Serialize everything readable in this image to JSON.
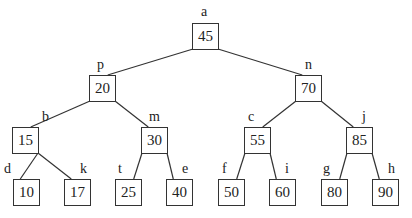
{
  "diagram": {
    "type": "binary-search-tree",
    "stroke_color": "#333333",
    "nodes": [
      {
        "id": "a",
        "label": "a",
        "value": "45",
        "x": 192,
        "y": 23,
        "lx": 201,
        "ly": 5
      },
      {
        "id": "p",
        "label": "p",
        "value": "20",
        "x": 89,
        "y": 75,
        "lx": 97,
        "ly": 58
      },
      {
        "id": "n",
        "label": "n",
        "value": "70",
        "x": 295,
        "y": 75,
        "lx": 305,
        "ly": 58
      },
      {
        "id": "b",
        "label": "b",
        "value": "15",
        "x": 12,
        "y": 127,
        "lx": 42,
        "ly": 110
      },
      {
        "id": "m",
        "label": "m",
        "value": "30",
        "x": 141,
        "y": 127,
        "lx": 149,
        "ly": 110
      },
      {
        "id": "c",
        "label": "c",
        "value": "55",
        "x": 244,
        "y": 127,
        "lx": 248,
        "ly": 110
      },
      {
        "id": "j",
        "label": "j",
        "value": "85",
        "x": 346,
        "y": 127,
        "lx": 362,
        "ly": 110
      },
      {
        "id": "d",
        "label": "d",
        "value": "10",
        "x": 13,
        "y": 179,
        "lx": 4,
        "ly": 162
      },
      {
        "id": "k",
        "label": "k",
        "value": "17",
        "x": 64,
        "y": 179,
        "lx": 80,
        "ly": 162
      },
      {
        "id": "t",
        "label": "t",
        "value": "25",
        "x": 115,
        "y": 179,
        "lx": 118,
        "ly": 162
      },
      {
        "id": "e",
        "label": "e",
        "value": "40",
        "x": 166,
        "y": 179,
        "lx": 182,
        "ly": 162
      },
      {
        "id": "f",
        "label": "f",
        "value": "50",
        "x": 218,
        "y": 179,
        "lx": 222,
        "ly": 162
      },
      {
        "id": "i",
        "label": "i",
        "value": "60",
        "x": 269,
        "y": 179,
        "lx": 285,
        "ly": 162
      },
      {
        "id": "g",
        "label": "g",
        "value": "80",
        "x": 321,
        "y": 179,
        "lx": 323,
        "ly": 162
      },
      {
        "id": "h",
        "label": "h",
        "value": "90",
        "x": 372,
        "y": 179,
        "lx": 388,
        "ly": 162
      }
    ],
    "edges": [
      [
        "a",
        "p"
      ],
      [
        "a",
        "n"
      ],
      [
        "p",
        "b"
      ],
      [
        "p",
        "m"
      ],
      [
        "n",
        "c"
      ],
      [
        "n",
        "j"
      ],
      [
        "b",
        "d"
      ],
      [
        "b",
        "k"
      ],
      [
        "m",
        "t"
      ],
      [
        "m",
        "e"
      ],
      [
        "c",
        "f"
      ],
      [
        "c",
        "i"
      ],
      [
        "j",
        "g"
      ],
      [
        "j",
        "h"
      ]
    ]
  }
}
